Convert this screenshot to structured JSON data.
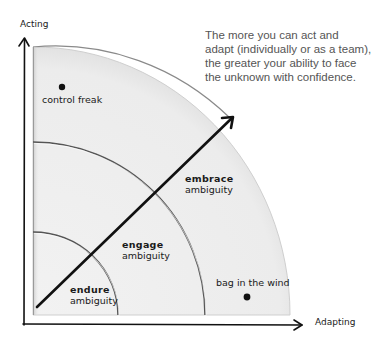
{
  "diagram": {
    "caption_lines": [
      "The more you can act and",
      "adapt (individually or as a team),",
      "the greater your ability to face",
      "the unknown with confidence."
    ],
    "axes": {
      "y_label": "Acting",
      "x_label": "Adapting"
    },
    "zones": [
      {
        "id": "endure",
        "line1": "endure",
        "line2": "ambiguity"
      },
      {
        "id": "engage",
        "line1": "engage",
        "line2": "ambiguity"
      },
      {
        "id": "embrace",
        "line1": "embrace",
        "line2": "ambiguity"
      }
    ],
    "points": [
      {
        "id": "control-freak",
        "label": "control freak"
      },
      {
        "id": "bag-in-the-wind",
        "label": "bag in the wind"
      }
    ],
    "colors": {
      "region_fill": "#ebebeb",
      "region_edge": "#d4d4d4",
      "arc_stroke": "#555555",
      "ink": "#111111",
      "caption_text": "#555555"
    }
  }
}
